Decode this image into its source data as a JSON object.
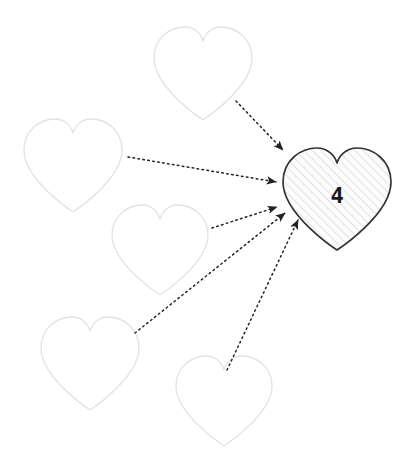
{
  "canvas": {
    "width": 420,
    "height": 472,
    "background": "#ffffff"
  },
  "style": {
    "outline_heart_stroke": "#e2e2e2",
    "outline_heart_fill": "#ffffff",
    "target_heart_stroke": "#333333",
    "target_heart_fill": "#fafafa",
    "hatch_color": "#dcdcdc",
    "arrow_color": "#222222",
    "label_color": "#1a1a1a"
  },
  "diagram": {
    "type": "node-arrow-diagram",
    "shape": "heart",
    "source_count": 5,
    "target_count": 1,
    "arrow_count": 5,
    "arrow_style": "dotted",
    "arrow_direction": "sources-to-target"
  },
  "target_heart": {
    "name": "filled-heart",
    "label": "4",
    "cx": 337,
    "cy": 196,
    "width": 110,
    "height": 108,
    "filled": true,
    "hatched": true
  },
  "source_hearts": [
    {
      "name": "heart-top",
      "cx": 203,
      "cy": 74,
      "width": 98,
      "height": 92
    },
    {
      "name": "heart-upper-left",
      "cx": 73,
      "cy": 166,
      "width": 98,
      "height": 92
    },
    {
      "name": "heart-middle-left",
      "cx": 160,
      "cy": 250,
      "width": 96,
      "height": 90
    },
    {
      "name": "heart-lower-left",
      "cx": 90,
      "cy": 364,
      "width": 98,
      "height": 92
    },
    {
      "name": "heart-bottom",
      "cx": 224,
      "cy": 401,
      "width": 96,
      "height": 90
    }
  ],
  "arrows": [
    {
      "name": "arrow-from-top",
      "from": "heart-top",
      "to": "filled-heart",
      "x1": 236,
      "y1": 101,
      "x2": 285,
      "y2": 152
    },
    {
      "name": "arrow-from-upper-left",
      "from": "heart-upper-left",
      "to": "filled-heart",
      "x1": 128,
      "y1": 157,
      "x2": 278,
      "y2": 183
    },
    {
      "name": "arrow-from-middle-left",
      "from": "heart-middle-left",
      "to": "filled-heart",
      "x1": 212,
      "y1": 228,
      "x2": 279,
      "y2": 208
    },
    {
      "name": "arrow-from-lower-left",
      "from": "heart-lower-left",
      "to": "filled-heart",
      "x1": 135,
      "y1": 333,
      "x2": 287,
      "y2": 215
    },
    {
      "name": "arrow-from-bottom",
      "from": "heart-bottom",
      "to": "filled-heart",
      "x1": 227,
      "y1": 370,
      "x2": 300,
      "y2": 222
    }
  ]
}
